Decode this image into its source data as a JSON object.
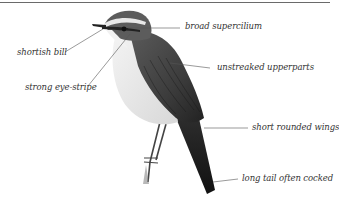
{
  "diagram": {
    "labels": {
      "broad_supercilium": "broad supercilium",
      "shortish_bill": "shortish bill",
      "unstreaked_upperparts": "unstreaked upperparts",
      "strong_eye_stripe": "strong eye-stripe",
      "short_rounded_wings": "short rounded wings",
      "long_tail": "long tail often cocked"
    },
    "colors": {
      "rule": "#6a6a6a",
      "leader": "#555555",
      "text": "#333333"
    }
  }
}
